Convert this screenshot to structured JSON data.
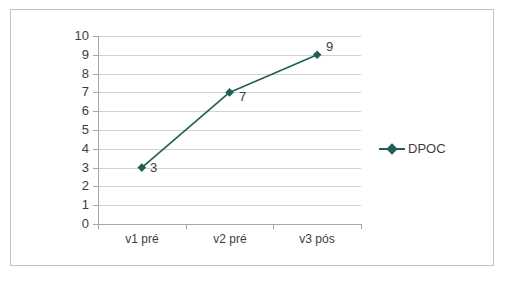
{
  "chart_data": {
    "type": "line",
    "title": "",
    "subtitle": "",
    "xlabel": "",
    "ylabel": "",
    "categories": [
      "v1 pré",
      "v2 pré",
      "v3 pós"
    ],
    "series": [
      {
        "name": "DPOC",
        "values": [
          3,
          7,
          9
        ],
        "color": "#1f5f56",
        "marker": "diamond",
        "data_labels": [
          "3",
          "7",
          "9"
        ]
      }
    ],
    "ylim": [
      0,
      10
    ],
    "y_ticks": [
      "10",
      "9",
      "8",
      "7",
      "6",
      "5",
      "4",
      "3",
      "2",
      "1",
      "0"
    ],
    "y_tick_values": [
      10,
      9,
      8,
      7,
      6,
      5,
      4,
      3,
      2,
      1,
      0
    ],
    "grid": true,
    "grid_axis": "y",
    "grid_color": "#d2d2d2",
    "axis_color": "#a6a6a6",
    "legend_position": "right",
    "plot_background": "#ffffff"
  },
  "legend": {
    "entries": [
      {
        "label": "DPOC",
        "marker_icon": "diamond-marker-icon"
      }
    ]
  },
  "frame": {
    "border_color": "#b9c4c4",
    "background": "#ffffff"
  },
  "caption": {
    "fragment": ""
  }
}
